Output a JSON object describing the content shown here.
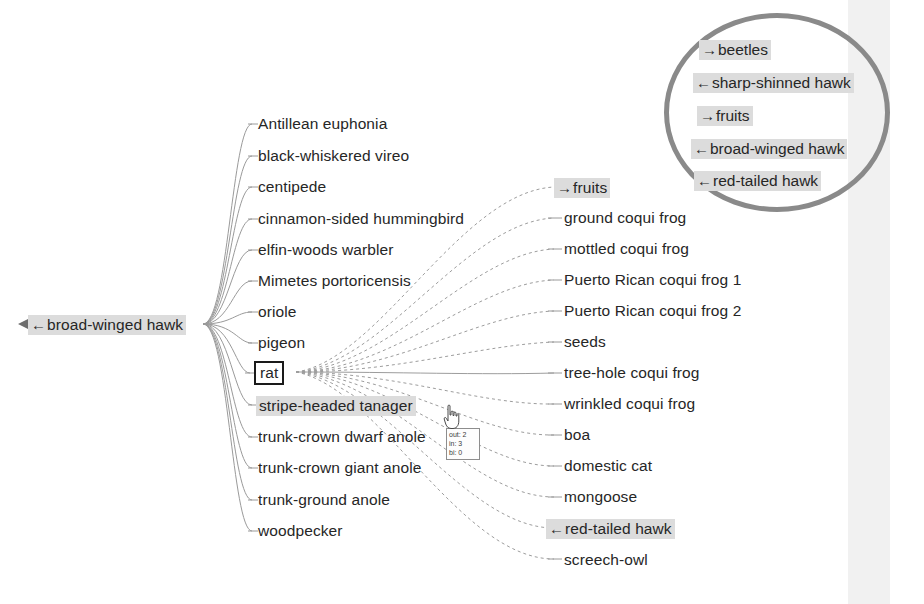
{
  "diagram": {
    "type": "food-web-node-link",
    "title_visible": false,
    "colors": {
      "text": "#262626",
      "highlight_background": "#dcdcdc",
      "ellipse_stroke": "#8a8a8a",
      "edge_stroke": "#9a9a9a",
      "selected_box_stroke": "#1a1a1a",
      "band_background": "#f1f1f1"
    }
  },
  "focus_node": {
    "label": "rat",
    "style": "boxed-selected"
  },
  "left_node": {
    "arrow": "←",
    "label": "broad-winged hawk",
    "highlighted": true
  },
  "middle_column": {
    "items": [
      {
        "label": "Antillean euphonia",
        "arrow": "",
        "highlighted": false,
        "boxed": false
      },
      {
        "label": "black-whiskered vireo",
        "arrow": "",
        "highlighted": false,
        "boxed": false
      },
      {
        "label": "centipede",
        "arrow": "",
        "highlighted": false,
        "boxed": false
      },
      {
        "label": "cinnamon-sided hummingbird",
        "arrow": "",
        "highlighted": false,
        "boxed": false
      },
      {
        "label": "elfin-woods warbler",
        "arrow": "",
        "highlighted": false,
        "boxed": false
      },
      {
        "label": "Mimetes portoricensis",
        "arrow": "",
        "highlighted": false,
        "boxed": false
      },
      {
        "label": "oriole",
        "arrow": "",
        "highlighted": false,
        "boxed": false
      },
      {
        "label": "pigeon",
        "arrow": "",
        "highlighted": false,
        "boxed": false
      },
      {
        "label": "rat",
        "arrow": "",
        "highlighted": false,
        "boxed": true
      },
      {
        "label": "stripe-headed tanager",
        "arrow": "",
        "highlighted": true,
        "boxed": false
      },
      {
        "label": "trunk-crown dwarf anole",
        "arrow": "",
        "highlighted": false,
        "boxed": false
      },
      {
        "label": "trunk-crown giant anole",
        "arrow": "",
        "highlighted": false,
        "boxed": false
      },
      {
        "label": "trunk-ground anole",
        "arrow": "",
        "highlighted": false,
        "boxed": false
      },
      {
        "label": "woodpecker",
        "arrow": "",
        "highlighted": false,
        "boxed": false
      }
    ]
  },
  "right_column": {
    "items": [
      {
        "label": "fruits",
        "arrow": "→",
        "highlighted": true
      },
      {
        "label": "ground coqui frog",
        "arrow": "",
        "highlighted": false
      },
      {
        "label": "mottled coqui frog",
        "arrow": "",
        "highlighted": false
      },
      {
        "label": "Puerto Rican coqui frog 1",
        "arrow": "",
        "highlighted": false
      },
      {
        "label": "Puerto Rican coqui frog 2",
        "arrow": "",
        "highlighted": false
      },
      {
        "label": "seeds",
        "arrow": "",
        "highlighted": false
      },
      {
        "label": "tree-hole coqui frog",
        "arrow": "",
        "highlighted": false
      },
      {
        "label": "wrinkled coqui frog",
        "arrow": "",
        "highlighted": false
      },
      {
        "label": "boa",
        "arrow": "",
        "highlighted": false
      },
      {
        "label": "domestic cat",
        "arrow": "",
        "highlighted": false
      },
      {
        "label": "mongoose",
        "arrow": "",
        "highlighted": false
      },
      {
        "label": "red-tailed hawk",
        "arrow": "←",
        "highlighted": true
      },
      {
        "label": "screech-owl",
        "arrow": "",
        "highlighted": false
      }
    ]
  },
  "ellipse_group": {
    "items": [
      {
        "arrow": "→",
        "label": "beetles"
      },
      {
        "arrow": "←",
        "label": "sharp-shinned hawk"
      },
      {
        "arrow": "→",
        "label": "fruits"
      },
      {
        "arrow": "←",
        "label": "broad-winged hawk"
      },
      {
        "arrow": "←",
        "label": "red-tailed hawk"
      }
    ]
  },
  "tooltip": {
    "out_label": "out: 2",
    "in_label": "in: 3",
    "bi_label": "bi: 0"
  },
  "cursor": {
    "icon": "hand-pointer-cursor"
  }
}
